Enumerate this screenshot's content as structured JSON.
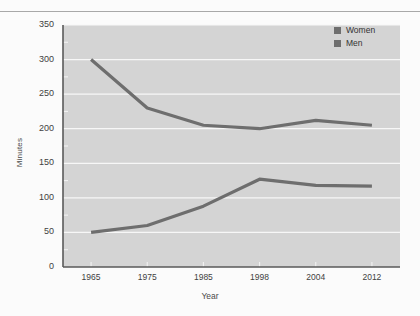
{
  "chart_data": {
    "type": "line",
    "title": "",
    "xlabel": "Year",
    "ylabel": "Minutes",
    "categories": [
      "1965",
      "1975",
      "1985",
      "1998",
      "2004",
      "2012"
    ],
    "ylim": [
      0,
      350
    ],
    "ytick_labels": [
      "0",
      "50",
      "100",
      "150",
      "200",
      "250",
      "300",
      "350"
    ],
    "ytick_values": [
      0,
      50,
      100,
      150,
      200,
      250,
      300,
      350
    ],
    "minor_tick_step": 25,
    "grid": "horizontal-major",
    "legend_position": "top-right",
    "series": [
      {
        "name": "Women",
        "color": "#6e6e6e",
        "values": [
          50,
          60,
          88,
          127,
          118,
          117
        ]
      },
      {
        "name": "Men",
        "color": "#6e6e6e",
        "values": [
          300,
          230,
          205,
          200,
          212,
          205
        ]
      }
    ]
  },
  "legend": {
    "items": [
      {
        "label": "Women"
      },
      {
        "label": "Men"
      }
    ]
  },
  "colors": {
    "line": "#6e6e6e",
    "plot_background": "#d4d4d4",
    "gridline": "#f7f7f7",
    "axis": "#5a5a5a",
    "page_background": "#fbfbfb",
    "rule": "#a8a8a8"
  }
}
